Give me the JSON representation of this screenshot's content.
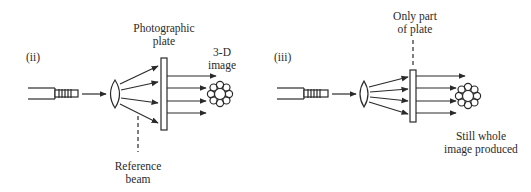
{
  "diagram": {
    "type": "holography-schematic",
    "colors": {
      "stroke": "#2a2a2a",
      "background": "#ffffff"
    },
    "panels": [
      {
        "id": "ii",
        "label": "(ii)",
        "components": [
          "laser-icon",
          "lens-icon",
          "photographic-plate",
          "flower-image-icon"
        ],
        "labels": {
          "plate_line1": "Photographic",
          "plate_line2": "plate",
          "image_line1": "3-D",
          "image_line2": "image",
          "reference_line1": "Reference",
          "reference_line2": "beam"
        }
      },
      {
        "id": "iii",
        "label": "(iii)",
        "components": [
          "laser-icon",
          "lens-icon",
          "partial-plate",
          "flower-image-icon"
        ],
        "labels": {
          "plate_line1": "Only part",
          "plate_line2": "of plate",
          "result_line1": "Still whole",
          "result_line2": "image produced"
        }
      }
    ]
  }
}
